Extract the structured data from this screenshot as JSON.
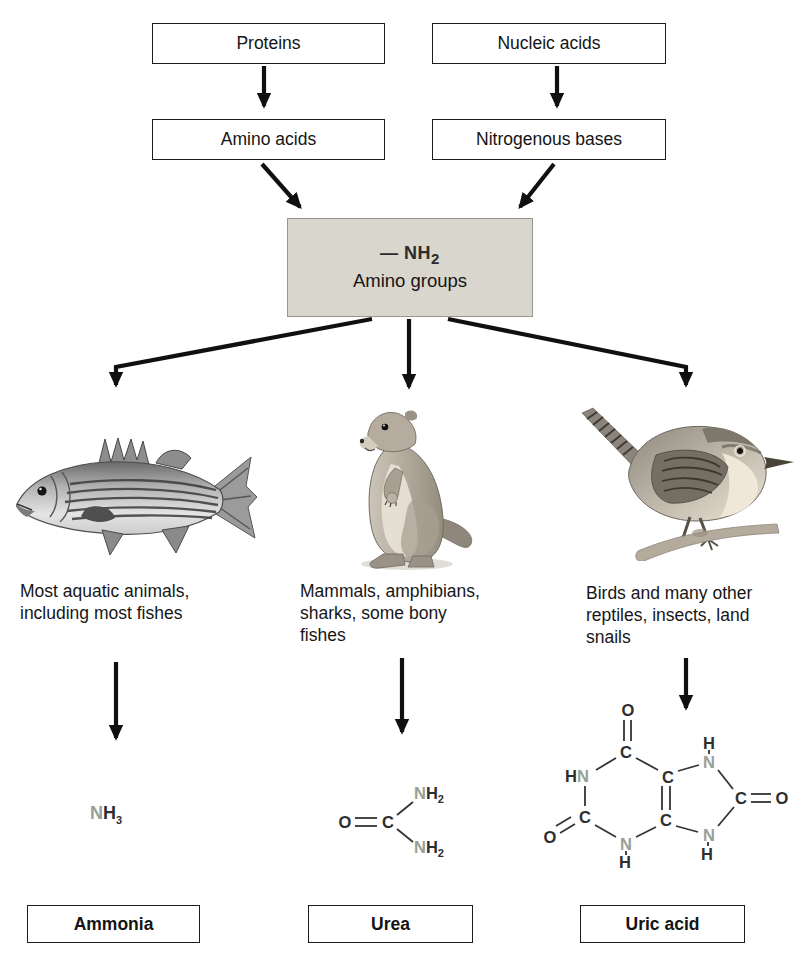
{
  "diagram": {
    "boxes": {
      "proteins": "Proteins",
      "nucleic_acids": "Nucleic acids",
      "amino_acids": "Amino acids",
      "nitrogenous_bases": "Nitrogenous bases",
      "amino_groups": "Amino groups"
    },
    "amino_formula": {
      "dash": "—",
      "n": "N",
      "h": "H",
      "sub": "2"
    },
    "captions": {
      "ammonia": "Most aquatic animals, including most fishes",
      "urea": "Mammals, amphibians, sharks, some bony fishes",
      "uric_acid": "Birds and many other reptiles, insects, land snails"
    },
    "animals": {
      "left": "striped-bass-fish",
      "middle": "prairie-dog",
      "right": "wren-bird"
    },
    "molecules": {
      "ammonia": {
        "n": "N",
        "h": "H",
        "sub": "3"
      },
      "urea": {
        "o": "O",
        "c": "C",
        "n": "N",
        "h": "H",
        "sub": "2"
      },
      "uric_acid": {
        "o": "O",
        "c": "C",
        "n": "N",
        "h": "H"
      }
    },
    "product_labels": {
      "ammonia": "Ammonia",
      "urea": "Urea",
      "uric_acid": "Uric acid"
    },
    "colors": {
      "nitrogen": "#96A096",
      "amino_box_fill": "#D9D6CE",
      "ink": "#1C1C1C"
    }
  }
}
